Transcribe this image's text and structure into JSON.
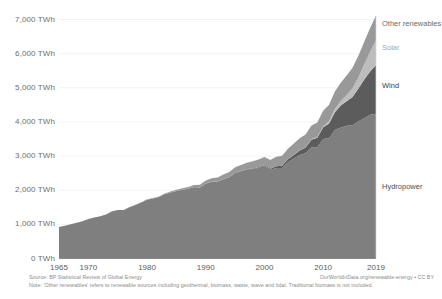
{
  "chart_data": {
    "type": "area",
    "title": "",
    "stacked": true,
    "xlabel": "",
    "ylabel": "",
    "xlim": [
      1965,
      2019
    ],
    "ylim": [
      0,
      7000
    ],
    "grid": true,
    "legend_position": "right-inline-labels",
    "y_unit": "TWh",
    "y_ticks": [
      0,
      1000,
      2000,
      3000,
      4000,
      5000,
      6000,
      7000
    ],
    "y_tick_labels": [
      "0 TWh",
      "1,000 TWh",
      "2,000 TWh",
      "3,000 TWh",
      "4,000 TWh",
      "5,000 TWh",
      "6,000 TWh",
      "7,000 TWh"
    ],
    "x_ticks": [
      1965,
      1970,
      1980,
      1990,
      2000,
      2010,
      2019
    ],
    "x_tick_labels": [
      "1965",
      "1970",
      "1980",
      "1990",
      "2000",
      "2010",
      "2019"
    ],
    "x": [
      1965,
      1966,
      1967,
      1968,
      1969,
      1970,
      1971,
      1972,
      1973,
      1974,
      1975,
      1976,
      1977,
      1978,
      1979,
      1980,
      1981,
      1982,
      1983,
      1984,
      1985,
      1986,
      1987,
      1988,
      1989,
      1990,
      1991,
      1992,
      1993,
      1994,
      1995,
      1996,
      1997,
      1998,
      1999,
      2000,
      2001,
      2002,
      2003,
      2004,
      2005,
      2006,
      2007,
      2008,
      2009,
      2010,
      2011,
      2012,
      2013,
      2014,
      2015,
      2016,
      2017,
      2018,
      2019
    ],
    "series": [
      {
        "name": "Hydropower",
        "color": "#7f7f7f",
        "label_color": "#4d4d4d",
        "values": [
          925,
          960,
          1000,
          1050,
          1090,
          1160,
          1200,
          1240,
          1290,
          1380,
          1420,
          1420,
          1500,
          1570,
          1640,
          1720,
          1760,
          1800,
          1880,
          1930,
          1980,
          2010,
          2040,
          2090,
          2080,
          2190,
          2240,
          2250,
          2320,
          2380,
          2500,
          2550,
          2600,
          2620,
          2650,
          2700,
          2590,
          2650,
          2650,
          2820,
          2930,
          3030,
          3080,
          3260,
          3260,
          3500,
          3520,
          3760,
          3840,
          3890,
          3900,
          4020,
          4110,
          4210,
          4240
        ]
      },
      {
        "name": "Wind",
        "color": "#5c5c5c",
        "label_color": "#3d3d3d",
        "values": [
          0,
          0,
          0,
          0,
          0,
          0,
          0,
          0,
          0,
          0,
          0,
          0,
          0,
          0,
          0,
          0,
          0,
          0,
          0,
          0,
          0,
          0,
          0,
          1,
          2,
          4,
          5,
          6,
          7,
          8,
          9,
          10,
          13,
          17,
          23,
          31,
          38,
          52,
          63,
          85,
          104,
          133,
          171,
          221,
          276,
          342,
          437,
          525,
          638,
          712,
          832,
          960,
          1134,
          1270,
          1430
        ]
      },
      {
        "name": "Solar",
        "color": "#bdbdbd",
        "label_color": "#a8a8a8",
        "values": [
          0,
          0,
          0,
          0,
          0,
          0,
          0,
          0,
          0,
          0,
          0,
          0,
          0,
          0,
          0,
          0,
          0,
          0,
          0,
          0,
          0,
          0,
          0,
          0,
          0,
          0,
          0,
          0,
          0,
          0,
          0,
          0,
          0,
          1,
          1,
          1,
          1,
          2,
          2,
          3,
          4,
          5,
          7,
          12,
          20,
          32,
          64,
          97,
          134,
          190,
          256,
          328,
          445,
          579,
          724
        ]
      },
      {
        "name": "Other renewables",
        "color": "#999999",
        "label_color": "#6b6b6b",
        "values": [
          0,
          0,
          0,
          0,
          0,
          0,
          0,
          0,
          0,
          2,
          3,
          4,
          5,
          7,
          9,
          12,
          15,
          19,
          24,
          30,
          37,
          45,
          54,
          65,
          78,
          92,
          105,
          118,
          131,
          145,
          160,
          176,
          192,
          209,
          226,
          244,
          259,
          275,
          292,
          310,
          330,
          352,
          375,
          400,
          425,
          452,
          480,
          508,
          538,
          570,
          600,
          630,
          660,
          690,
          720
        ]
      }
    ],
    "source": "Source: BP Statistical Review of Global Energy",
    "note": "Note: 'Other renewables' refers to renewable sources including geothermal, biomass, waste, wave and tidal. Traditional biomass is not included.",
    "credit": "OurWorldInData.org/renewable-energy • CC BY",
    "axis_color": "#8a8a8a",
    "grid_color": "#ececec"
  }
}
